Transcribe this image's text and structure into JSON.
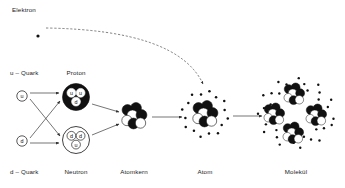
{
  "figure": {
    "title_visible": false,
    "language": "de",
    "background_color": "#ffffff",
    "ink_color": "#111111"
  },
  "labels": {
    "elektron": "Elektron",
    "u_quark": "u – Quark",
    "d_quark": "d – Quark",
    "proton": "Proton",
    "neutron": "Neutron",
    "atomkern": "Atomkern",
    "atom": "Atom",
    "molekuel": "Molekül"
  },
  "quark_symbols": {
    "u": "u",
    "d": "d"
  },
  "composition": {
    "proton_quarks": [
      "u",
      "u",
      "d"
    ],
    "neutron_quarks": [
      "d",
      "d",
      "u"
    ],
    "atomkern_nucleons": 7,
    "atom_electron_count": 16,
    "molecule_atom_count": 4
  },
  "colors": {
    "proton_fill": "#111111",
    "proton_quark_fill": "#ffffff",
    "neutron_fill": "#ffffff",
    "neutron_stroke": "#111111",
    "electron_dot": "#111111",
    "nucleon_dark": "#111111",
    "nucleon_light": "#ffffff",
    "line": "#3a3a3a"
  },
  "label_positions": {
    "elektron": {
      "x": 12,
      "y": 7,
      "align": "left"
    },
    "u_quark": {
      "x": 10,
      "y": 70,
      "align": "left"
    },
    "d_quark": {
      "x": 10,
      "y": 169,
      "align": "left"
    },
    "proton": {
      "x": 76,
      "y": 70,
      "align": "center"
    },
    "neutron": {
      "x": 76,
      "y": 169,
      "align": "center"
    },
    "atomkern": {
      "x": 134,
      "y": 169,
      "align": "center"
    },
    "atom": {
      "x": 205,
      "y": 169,
      "align": "center"
    },
    "molekuel": {
      "x": 296,
      "y": 169,
      "align": "center"
    }
  },
  "nodes": {
    "electron_dot": {
      "cx": 38,
      "cy": 36,
      "r": 1.6
    },
    "u_quark_circle": {
      "cx": 22,
      "cy": 96,
      "r": 5.2
    },
    "d_quark_circle": {
      "cx": 22,
      "cy": 141,
      "r": 5.2
    },
    "proton": {
      "cx": 76,
      "cy": 97,
      "r": 13.5
    },
    "neutron": {
      "cx": 76,
      "cy": 140,
      "r": 13.5
    },
    "atomkern": {
      "cx": 134,
      "cy": 116,
      "r": 14
    },
    "atom": {
      "cx": 205,
      "cy": 114,
      "r": 24
    },
    "molekuel": {
      "cx": 296,
      "cy": 113,
      "r": 42
    }
  },
  "arrows": {
    "u_to_proton": {
      "x1": 30,
      "y1": 93,
      "x2": 59,
      "y2": 93
    },
    "u_to_neutron": {
      "x1": 30,
      "y1": 99,
      "x2": 60,
      "y2": 136
    },
    "d_to_proton": {
      "x1": 30,
      "y1": 138,
      "x2": 60,
      "y2": 101
    },
    "d_to_neutron": {
      "x1": 30,
      "y1": 143,
      "x2": 59,
      "y2": 143
    },
    "proton_to_kern": {
      "x1": 92,
      "y1": 104,
      "x2": 119,
      "y2": 112
    },
    "neutron_to_kern": {
      "x1": 92,
      "y1": 135,
      "x2": 119,
      "y2": 124
    },
    "kern_to_atom": {
      "x1": 152,
      "y1": 117,
      "x2": 182,
      "y2": 117
    },
    "atom_to_molekuel": {
      "x1": 233,
      "y1": 116,
      "x2": 262,
      "y2": 116
    },
    "electron_trajectory": {
      "start_x": 46,
      "start_y": 28,
      "control_x": 178,
      "control_y": 30,
      "end_x": 203,
      "end_y": 84
    }
  },
  "nucleon_cluster": [
    {
      "dx": -6.5,
      "dy": -6.0,
      "r": 5.4,
      "dark": true
    },
    {
      "dx": 2.0,
      "dy": -8.0,
      "r": 5.4,
      "dark": true
    },
    {
      "dx": -1.5,
      "dy": -0.5,
      "r": 5.6,
      "dark": false
    },
    {
      "dx": 7.5,
      "dy": -1.0,
      "r": 5.4,
      "dark": true
    },
    {
      "dx": -7.0,
      "dy": 4.5,
      "r": 5.2,
      "dark": false
    },
    {
      "dx": -0.5,
      "dy": 7.5,
      "r": 5.4,
      "dark": true
    },
    {
      "dx": 6.5,
      "dy": 7.0,
      "r": 5.2,
      "dark": false
    }
  ],
  "molecule_atom_offsets": [
    {
      "dx": -22,
      "dy": 1
    },
    {
      "dx": -2,
      "dy": -19
    },
    {
      "dx": 20,
      "dy": 2
    },
    {
      "dx": -3,
      "dy": 20
    }
  ]
}
